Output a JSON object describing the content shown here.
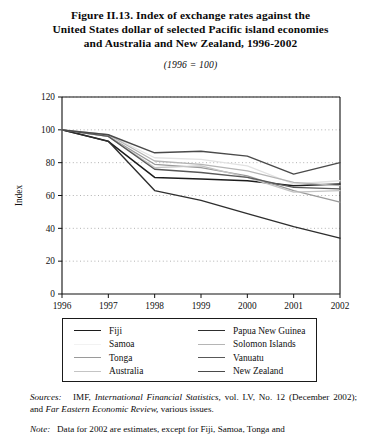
{
  "title": {
    "line1": "Figure II.13.   Index of exchange rates against the",
    "line2": "United States dollar of selected Pacific island economies",
    "line3": "and Australia and New Zealand, 1996-2002",
    "subtitle": "(1996 = 100)"
  },
  "chart_data": {
    "type": "line",
    "title": "Figure II.13. Index of exchange rates against the United States dollar of selected Pacific island economies and Australia and New Zealand, 1996-2002",
    "subtitle": "(1996 = 100)",
    "xlabel": "",
    "ylabel": "Index",
    "x": [
      1996,
      1997,
      1998,
      1999,
      2000,
      2001,
      2002
    ],
    "categories": [
      "1996",
      "1997",
      "1998",
      "1999",
      "2000",
      "2001",
      "2002"
    ],
    "xlim": [
      1996,
      2002
    ],
    "ylim": [
      0,
      120
    ],
    "yticks": [
      0,
      20,
      40,
      60,
      80,
      100,
      120
    ],
    "xticks": [
      "1996",
      "1997",
      "1998",
      "1999",
      "2000",
      "2001",
      "2002"
    ],
    "grid": true,
    "grid_style": "dotted-horizontal",
    "legend_position": "below",
    "series": [
      {
        "name": "Fiji",
        "color": "#1c1c1c",
        "width": 1.5,
        "values": [
          100,
          93,
          71,
          70,
          69,
          66,
          67
        ]
      },
      {
        "name": "Samoa",
        "color": "#e2e2e2",
        "width": 1.3,
        "values": [
          100,
          97,
          83,
          82,
          78,
          67,
          69
        ]
      },
      {
        "name": "Tonga",
        "color": "#9a9a9a",
        "width": 1.3,
        "values": [
          100,
          96,
          79,
          77,
          72,
          63,
          56
        ]
      },
      {
        "name": "Australia",
        "color": "#c4c4c4",
        "width": 1.3,
        "values": [
          100,
          96,
          77,
          78,
          71,
          62,
          63
        ]
      },
      {
        "name": "Papua New Guinea",
        "color": "#2e2e2e",
        "width": 1.4,
        "values": [
          100,
          93,
          63,
          57,
          49,
          41,
          34
        ]
      },
      {
        "name": "Solomon Islands",
        "color": "#b5b5b5",
        "width": 1.3,
        "values": [
          100,
          97,
          81,
          79,
          75,
          68,
          66
        ]
      },
      {
        "name": "Vanuatu",
        "color": "#585858",
        "width": 1.3,
        "values": [
          100,
          96,
          76,
          74,
          71,
          65,
          64
        ]
      },
      {
        "name": "New Zealand",
        "color": "#4a4a4a",
        "width": 1.4,
        "values": [
          100,
          97,
          86,
          87,
          84,
          73,
          80
        ]
      }
    ]
  },
  "legend": {
    "entries": [
      {
        "label": "Fiji",
        "color": "#1c1c1c",
        "width": "1.7px"
      },
      {
        "label": "Papua New Guinea",
        "color": "#2e2e2e",
        "width": "1.6px"
      },
      {
        "label": "Samoa",
        "color": "#f2f2f2",
        "width": "1.2px"
      },
      {
        "label": "Solomon Islands",
        "color": "#b5b5b5",
        "width": "1.3px"
      },
      {
        "label": "Tonga",
        "color": "#9a9a9a",
        "width": "1.3px"
      },
      {
        "label": "Vanuatu",
        "color": "#585858",
        "width": "1.5px"
      },
      {
        "label": "Australia",
        "color": "#c4c4c4",
        "width": "1.3px"
      },
      {
        "label": "New Zealand",
        "color": "#4a4a4a",
        "width": "1.6px"
      }
    ]
  },
  "notes": {
    "sources_label": "Sources:",
    "sources_text_a": "IMF,",
    "sources_italic_a": "International Financial Statistics,",
    "sources_text_b": "vol. LV, No. 12 (December 2002); and",
    "sources_italic_b": "Far Eastern Economic Review,",
    "sources_text_c": "various issues.",
    "note_label": "Note:",
    "note_text": "Data for 2002 are estimates, except for Fiji, Samoa, Tonga and"
  }
}
